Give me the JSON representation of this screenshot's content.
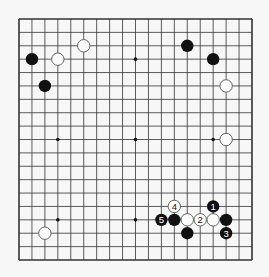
{
  "diagram": {
    "type": "go-board",
    "size": 19,
    "colors": {
      "background": "#f7f7f7",
      "line": "#333333",
      "black": "#111111",
      "white": "#ffffff",
      "white_outline": "#555555"
    },
    "star_points": [
      [
        3,
        3
      ],
      [
        9,
        3
      ],
      [
        15,
        3
      ],
      [
        3,
        9
      ],
      [
        9,
        9
      ],
      [
        15,
        9
      ],
      [
        3,
        15
      ],
      [
        9,
        15
      ],
      [
        15,
        15
      ]
    ],
    "stones": [
      {
        "col": 5,
        "row": 2,
        "color": "white",
        "label": ""
      },
      {
        "col": 1,
        "row": 3,
        "color": "black",
        "label": ""
      },
      {
        "col": 3,
        "row": 3,
        "color": "white",
        "label": ""
      },
      {
        "col": 2,
        "row": 5,
        "color": "black",
        "label": ""
      },
      {
        "col": 13,
        "row": 2,
        "color": "black",
        "label": ""
      },
      {
        "col": 15,
        "row": 3,
        "color": "black",
        "label": ""
      },
      {
        "col": 16,
        "row": 5,
        "color": "white",
        "label": ""
      },
      {
        "col": 16,
        "row": 9,
        "color": "white",
        "label": ""
      },
      {
        "col": 2,
        "row": 16,
        "color": "white",
        "label": ""
      },
      {
        "col": 12,
        "row": 14,
        "color": "white",
        "label": "4"
      },
      {
        "col": 15,
        "row": 14,
        "color": "black",
        "label": "1"
      },
      {
        "col": 11,
        "row": 15,
        "color": "black",
        "label": "5"
      },
      {
        "col": 12,
        "row": 15,
        "color": "black",
        "label": ""
      },
      {
        "col": 13,
        "row": 15,
        "color": "white",
        "label": ""
      },
      {
        "col": 14,
        "row": 15,
        "color": "white",
        "label": "2"
      },
      {
        "col": 15,
        "row": 15,
        "color": "white",
        "label": ""
      },
      {
        "col": 16,
        "row": 15,
        "color": "black",
        "label": ""
      },
      {
        "col": 13,
        "row": 16,
        "color": "black",
        "label": ""
      },
      {
        "col": 16,
        "row": 16,
        "color": "black",
        "label": "3"
      }
    ]
  }
}
